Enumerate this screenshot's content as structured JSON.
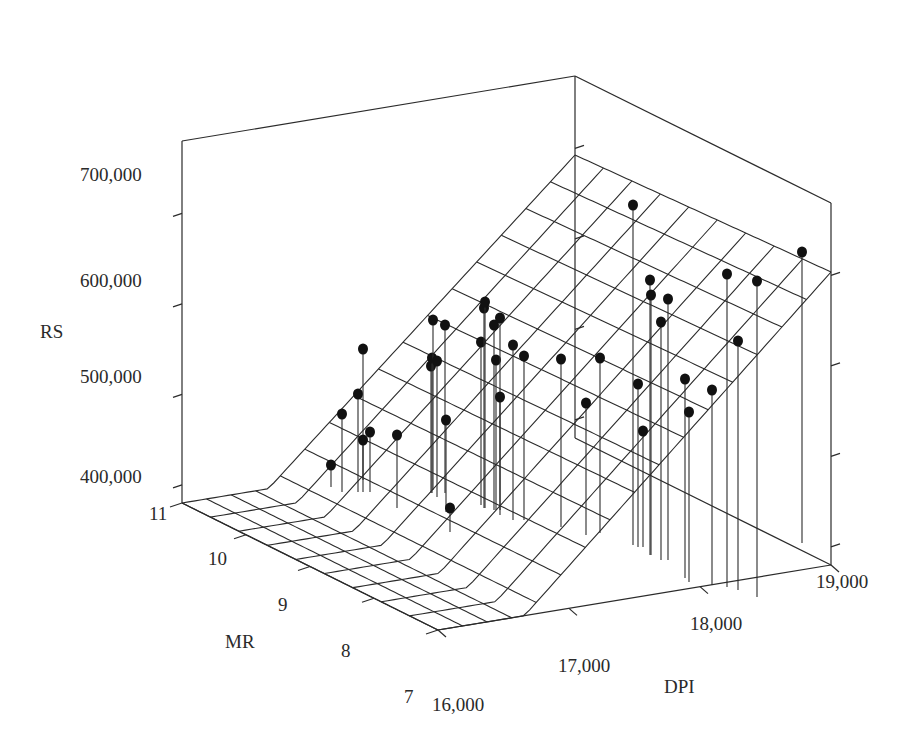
{
  "chart_data": {
    "type": "scatter",
    "subtype": "3d-scatter-with-regression-surface",
    "title": "",
    "axes": {
      "z": {
        "label": "RS",
        "ticks": [
          "400,000",
          "500,000",
          "600,000",
          "700,000"
        ],
        "tick_values": [
          400000,
          500000,
          600000,
          700000
        ],
        "range": [
          380000,
          780000
        ]
      },
      "x": {
        "label": "DPI",
        "ticks": [
          "16,000",
          "17,000",
          "18,000",
          "19,000"
        ],
        "tick_values": [
          16000,
          17000,
          18000,
          19000
        ],
        "range": [
          16000,
          19000
        ]
      },
      "y": {
        "label": "MR",
        "ticks": [
          "7",
          "8",
          "9",
          "10",
          "11"
        ],
        "tick_values": [
          7,
          8,
          9,
          10,
          11
        ],
        "range": [
          7,
          11
        ]
      }
    },
    "surface": {
      "description": "Fitted regression plane of RS on DPI and MR (wireframe grid), clipped at floor",
      "grid_dpi_lines": 16,
      "grid_mr_lines": 9
    },
    "points_note": "Approximate screen-space positions of observed data points (dots) and their drop-line base y",
    "points": [
      [
        331,
        465,
        487
      ],
      [
        342,
        414,
        492
      ],
      [
        358,
        394,
        492
      ],
      [
        363,
        349,
        480
      ],
      [
        363,
        440,
        492
      ],
      [
        370,
        432,
        492
      ],
      [
        397,
        435,
        508
      ],
      [
        431,
        366,
        493
      ],
      [
        432,
        358,
        493
      ],
      [
        433,
        320,
        490
      ],
      [
        437,
        361,
        497
      ],
      [
        445,
        325,
        493
      ],
      [
        446,
        420,
        512
      ],
      [
        450,
        508,
        532
      ],
      [
        481,
        342,
        505
      ],
      [
        484,
        308,
        508
      ],
      [
        485,
        302,
        508
      ],
      [
        494,
        325,
        510
      ],
      [
        496,
        360,
        510
      ],
      [
        500,
        318,
        510
      ],
      [
        500,
        397,
        515
      ],
      [
        513,
        345,
        520
      ],
      [
        524,
        356,
        520
      ],
      [
        561,
        359,
        527
      ],
      [
        586,
        403,
        535
      ],
      [
        600,
        358,
        533
      ],
      [
        633,
        205,
        545
      ],
      [
        638,
        384,
        547
      ],
      [
        643,
        431,
        547
      ],
      [
        650,
        280,
        555
      ],
      [
        651,
        295,
        555
      ],
      [
        661,
        322,
        560
      ],
      [
        668,
        299,
        560
      ],
      [
        685,
        379,
        578
      ],
      [
        689,
        412,
        582
      ],
      [
        712,
        390,
        585
      ],
      [
        727,
        274,
        587
      ],
      [
        738,
        341,
        590
      ],
      [
        757,
        281,
        597
      ],
      [
        802,
        252,
        543
      ]
    ]
  },
  "labels": {
    "rs": "RS",
    "mr": "MR",
    "dpi": "DPI",
    "rs_700": "700,000",
    "rs_600": "600,000",
    "rs_500": "500,000",
    "rs_400": "400,000",
    "mr_11": "11",
    "mr_10": "10",
    "mr_9": "9",
    "mr_8": "8",
    "mr_7": "7",
    "dpi_16": "16,000",
    "dpi_17": "17,000",
    "dpi_18": "18,000",
    "dpi_19": "19,000"
  },
  "style": {
    "line_color": "#2b2b2b",
    "dot_color": "#111111",
    "background": "#ffffff"
  }
}
